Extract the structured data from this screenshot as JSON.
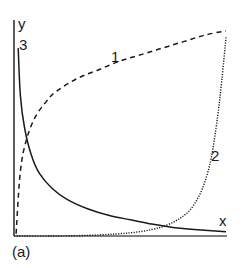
{
  "chart_data": {
    "type": "line",
    "title": "",
    "panel_label": "(a)",
    "xlabel": "x",
    "ylabel": "y",
    "xlim": [
      0,
      1
    ],
    "ylim": [
      0,
      1
    ],
    "grid": false,
    "legend": "inline curve labels",
    "ticks": "none",
    "series": [
      {
        "name": "1",
        "style": "dashed",
        "color": "#1a1a1a",
        "description": "concave increasing (logarithmic-like) curve",
        "x": [
          0.01,
          0.03,
          0.06,
          0.1,
          0.15,
          0.2,
          0.3,
          0.4,
          0.5,
          0.6,
          0.7,
          0.8,
          0.9,
          1.0
        ],
        "y": [
          0.01,
          0.3,
          0.45,
          0.55,
          0.62,
          0.67,
          0.73,
          0.77,
          0.81,
          0.84,
          0.87,
          0.9,
          0.93,
          0.95
        ]
      },
      {
        "name": "2",
        "style": "dotted",
        "color": "#1a1a1a",
        "description": "convex increasing (exponential-like) curve",
        "x": [
          0.0,
          0.2,
          0.4,
          0.55,
          0.65,
          0.72,
          0.78,
          0.83,
          0.87,
          0.9,
          0.93,
          0.96,
          0.98,
          1.0
        ],
        "y": [
          0.0,
          0.0,
          0.005,
          0.015,
          0.03,
          0.05,
          0.08,
          0.12,
          0.18,
          0.25,
          0.36,
          0.55,
          0.72,
          0.92
        ]
      },
      {
        "name": "3",
        "style": "solid",
        "color": "#1a1a1a",
        "description": "decreasing hyperbolic-like curve",
        "x": [
          0.02,
          0.03,
          0.05,
          0.08,
          0.12,
          0.18,
          0.25,
          0.35,
          0.45,
          0.55,
          0.65,
          0.75,
          0.85,
          1.0
        ],
        "y": [
          0.87,
          0.65,
          0.5,
          0.38,
          0.29,
          0.22,
          0.17,
          0.125,
          0.095,
          0.075,
          0.055,
          0.04,
          0.03,
          0.02
        ]
      }
    ],
    "annotations": [
      {
        "text": "1",
        "near_series": "1"
      },
      {
        "text": "2",
        "near_series": "2"
      },
      {
        "text": "3",
        "near_series": "3"
      }
    ]
  },
  "labels": {
    "y_axis": "y",
    "x_axis": "x",
    "curve1": "1",
    "curve2": "2",
    "curve3": "3",
    "panel": "(a)"
  }
}
